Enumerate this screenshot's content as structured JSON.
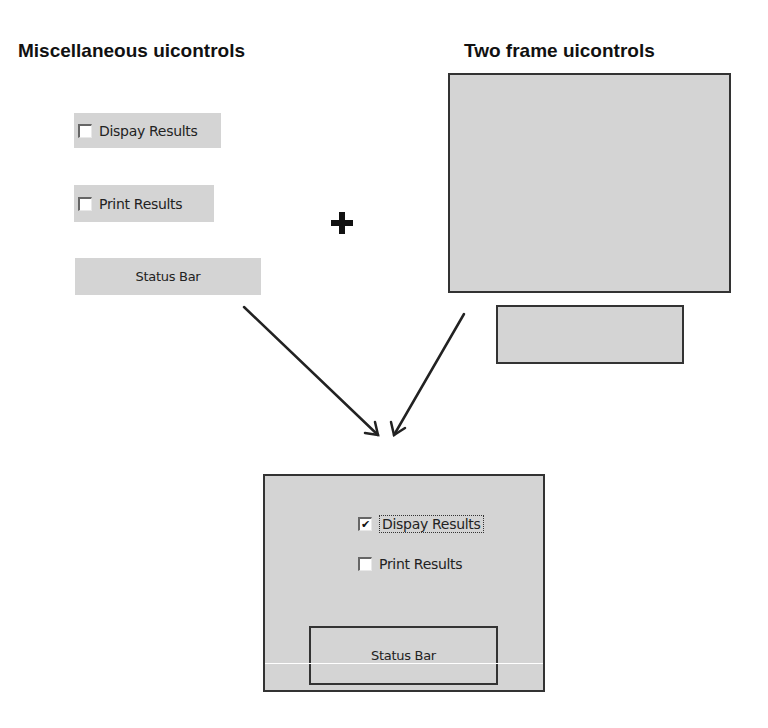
{
  "left_panel": {
    "title": "Miscellaneous uicontrols",
    "checkbox_display": {
      "label": "Dispay Results",
      "checked": false
    },
    "checkbox_print": {
      "label": "Print Results",
      "checked": false
    },
    "status_bar": {
      "label": "Status Bar"
    }
  },
  "right_panel": {
    "title": "Two frame uicontrols"
  },
  "operator": {
    "symbol": "+"
  },
  "result_panel": {
    "checkbox_display": {
      "label": "Dispay Results",
      "checked": true,
      "check_glyph": "✔"
    },
    "checkbox_print": {
      "label": "Print Results",
      "checked": false
    },
    "status_bar": {
      "label": "Status Bar"
    }
  },
  "colors": {
    "control_gray": "#d4d4d4",
    "frame_border": "#333333",
    "arrow": "#222222"
  }
}
